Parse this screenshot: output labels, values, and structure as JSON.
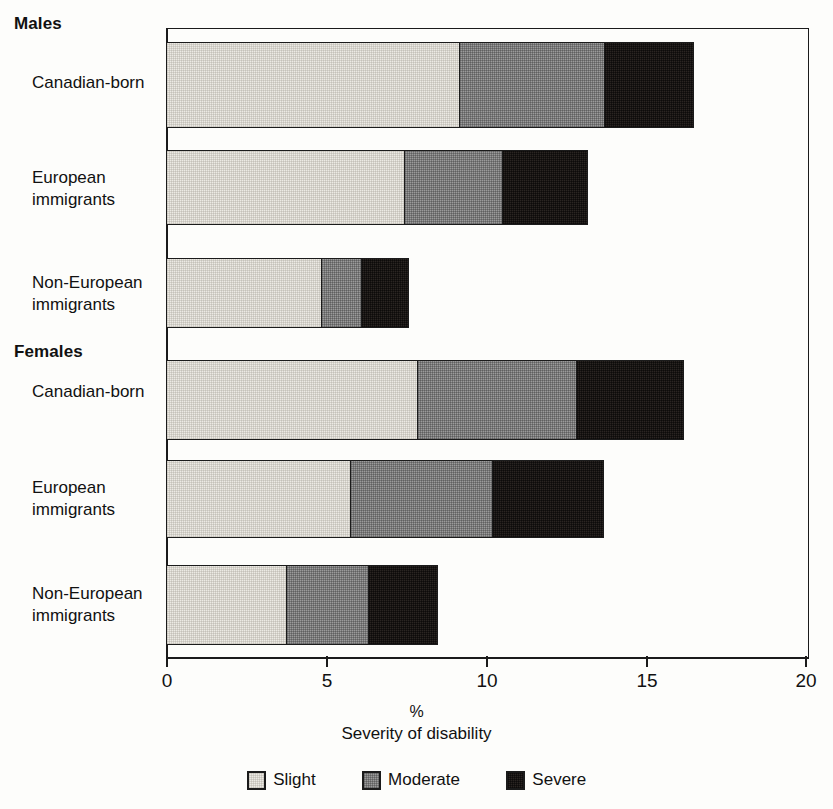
{
  "chart_data": {
    "type": "bar",
    "orientation": "horizontal",
    "stacked": true,
    "title": "",
    "xlabel": "Severity of disability",
    "xunit": "%",
    "ylabel": "",
    "xlim": [
      0,
      20
    ],
    "xticks": [
      "0",
      "5",
      "10",
      "15",
      "20"
    ],
    "grid": false,
    "legend_position": "bottom",
    "series": [
      {
        "name": "Slight",
        "color": "#eceae4",
        "values": [
          9.2,
          7.5,
          4.9,
          7.9,
          5.8,
          3.8
        ]
      },
      {
        "name": "Moderate",
        "color": "#9b9b9b",
        "values": [
          4.6,
          3.1,
          1.3,
          5.0,
          4.5,
          2.6
        ]
      },
      {
        "name": "Severe",
        "color": "#2a2522",
        "values": [
          2.8,
          2.7,
          1.5,
          3.4,
          3.5,
          2.2
        ]
      }
    ],
    "groups": [
      {
        "heading": "Males",
        "categories": [
          "Canadian-born",
          "European\nimmigrants",
          "Non-European\nimmigrants"
        ],
        "totals": [
          16.6,
          13.3,
          7.7
        ]
      },
      {
        "heading": "Females",
        "categories": [
          "Canadian-born",
          "European\nimmigrants",
          "Non-European\nimmigrants"
        ],
        "totals": [
          16.3,
          13.8,
          8.6
        ]
      }
    ],
    "categories": [
      "Males / Canadian-born",
      "Males / European immigrants",
      "Males / Non-European immigrants",
      "Females / Canadian-born",
      "Females / European immigrants",
      "Females / Non-European immigrants"
    ]
  },
  "axis": {
    "ticks": [
      {
        "label": "0"
      },
      {
        "label": "5"
      },
      {
        "label": "10"
      },
      {
        "label": "15"
      },
      {
        "label": "20"
      }
    ],
    "unit": "%",
    "title": "Severity of disability"
  },
  "groups": [
    {
      "heading": "Males"
    },
    {
      "heading": "Females"
    }
  ],
  "labels": [
    {
      "text": "Canadian-born"
    },
    {
      "text": "European\nimmigrants"
    },
    {
      "text": "Non-European\nimmigrants"
    },
    {
      "text": "Canadian-born"
    },
    {
      "text": "European\nimmigrants"
    },
    {
      "text": "Non-European\nimmigrants"
    }
  ],
  "legend": {
    "items": [
      {
        "label": "Slight",
        "color": "#eceae4"
      },
      {
        "label": "Moderate",
        "color": "#9b9b9b"
      },
      {
        "label": "Severe",
        "color": "#2a2522"
      }
    ]
  }
}
